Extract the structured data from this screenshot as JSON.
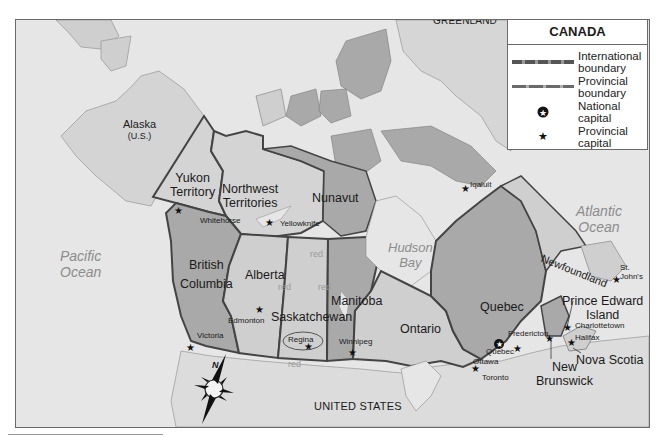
{
  "legend": {
    "title": "CANADA",
    "items": [
      {
        "symbol": "international-boundary-line",
        "label_1": "International",
        "label_2": "boundary"
      },
      {
        "symbol": "provincial-boundary-line",
        "label_1": "Provincial",
        "label_2": "boundary"
      },
      {
        "symbol": "national-capital-icon",
        "label_1": "National",
        "label_2": "capital"
      },
      {
        "symbol": "provincial-capital-icon",
        "label_1": "Provincial",
        "label_2": "capital"
      }
    ]
  },
  "oceans": {
    "arctic": "Arctic Ocean",
    "pacific_1": "Pacific",
    "pacific_2": "Ocean",
    "atlantic_1": "Atlantic",
    "atlantic_2": "Ocean",
    "hudson_1": "Hudson",
    "hudson_2": "Bay"
  },
  "countries": {
    "greenland": "GREENLAND",
    "alaska_1": "Alaska",
    "alaska_2": "(U.S.)",
    "usa": "UNITED STATES"
  },
  "provinces": {
    "yukon_1": "Yukon",
    "yukon_2": "Territory",
    "nwt_1": "Northwest",
    "nwt_2": "Territories",
    "nunavut": "Nunavut",
    "bc_1": "British",
    "bc_2": "Columbia",
    "alberta": "Alberta",
    "saskatchewan": "Saskatchewan",
    "manitoba": "Manitoba",
    "ontario": "Ontario",
    "quebec": "Quebec",
    "newfoundland": "Newfoundland",
    "pei_1": "Prince Edward",
    "pei_2": "Island",
    "nova_scotia": "Nova Scotia",
    "nb_1": "New",
    "nb_2": "Brunswick"
  },
  "cities": {
    "whitehorse": "Whitehorse",
    "yellowknife": "Yellowknife",
    "iqaluit": "Iqaluit",
    "victoria": "Victoria",
    "edmonton": "Edmonton",
    "regina": "Regina",
    "winnipeg": "Winnipeg",
    "toronto": "Toronto",
    "ottawa": "Ottawa",
    "quebec": "Quebec",
    "fredericton": "Fredericton",
    "charlottetown": "Charlottetown",
    "halifax": "Halifax",
    "st_johns_1": "St.",
    "st_johns_2": "John's"
  },
  "annotations": {
    "red": "red"
  },
  "compass": {
    "north": "N"
  },
  "colors": {
    "water": "#e6e6e6",
    "light_land": "#cfcfcf",
    "dark_land": "#a9a9a9",
    "boundary": "#4a4a4a"
  }
}
